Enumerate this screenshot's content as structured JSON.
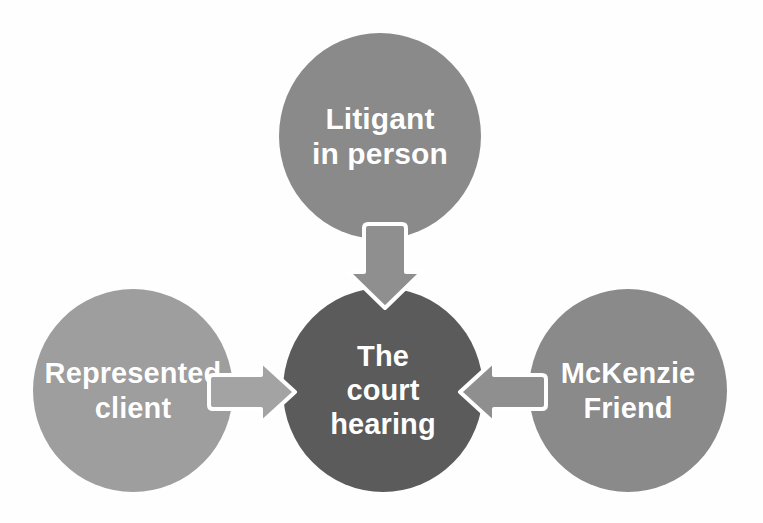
{
  "diagram": {
    "background_color": "#fefefe",
    "nodes": [
      {
        "id": "litigant-in-person",
        "label": "Litigant\nin person",
        "line1": "Litigant",
        "line2": "in person",
        "position": "top",
        "fill_color": "#8a8a8a",
        "text_color": "#ffffff"
      },
      {
        "id": "court-hearing",
        "label": "The\ncourt\nhearing",
        "line1": "The",
        "line2": "court",
        "line3": "hearing",
        "position": "center",
        "fill_color": "#5b5b5b",
        "text_color": "#ffffff"
      },
      {
        "id": "represented-client",
        "label": "Represented\nclient",
        "line1": "Represented",
        "line2": "client",
        "position": "left",
        "fill_color": "#9e9e9e",
        "text_color": "#ffffff"
      },
      {
        "id": "mckenzie-friend",
        "label": "McKenzie\nFriend",
        "line1": "McKenzie",
        "line2": "Friend",
        "position": "right",
        "fill_color": "#8a8a8a",
        "text_color": "#ffffff"
      }
    ],
    "arrows": [
      {
        "id": "arrow-top-to-center",
        "from": "litigant-in-person",
        "to": "court-hearing",
        "direction": "down",
        "fill_color": "#8f8f8f",
        "outline_color": "#ffffff"
      },
      {
        "id": "arrow-left-to-center",
        "from": "represented-client",
        "to": "court-hearing",
        "direction": "right",
        "fill_color": "#a3a3a3",
        "outline_color": "#ffffff"
      },
      {
        "id": "arrow-right-to-center",
        "from": "mckenzie-friend",
        "to": "court-hearing",
        "direction": "left",
        "fill_color": "#8f8f8f",
        "outline_color": "#ffffff"
      }
    ]
  }
}
